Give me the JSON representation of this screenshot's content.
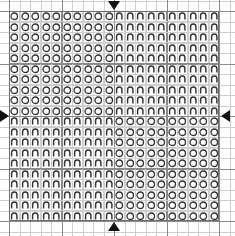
{
  "chart": {
    "grid": {
      "columns": 20,
      "rows": 20,
      "cell_size_px": 10.5,
      "bold_line_every": 5,
      "grid_visible": true
    },
    "colors": {
      "background": "#ffffff",
      "light_grid": "#cfcfcf",
      "bold_grid": "#8a8a8a",
      "outer_border": "#6e6e6e",
      "symbol_stroke": "#333333",
      "arrow": "#111111"
    },
    "legend": [
      {
        "key": "circle",
        "symbol_name": "open-circle-symbol",
        "glyph": "○"
      },
      {
        "key": "arch",
        "symbol_name": "arch-symbol",
        "glyph": "Ԡ"
      }
    ],
    "center_markers": [
      {
        "name": "top-center-arrow",
        "glyph": "▼",
        "edge": "top",
        "at_column": 10
      },
      {
        "name": "bottom-center-arrow",
        "glyph": "▲",
        "edge": "bottom",
        "at_column": 10
      },
      {
        "name": "left-center-arrow",
        "glyph": "▶",
        "edge": "left",
        "at_row": 10
      },
      {
        "name": "right-center-arrow",
        "glyph": "◀",
        "edge": "right",
        "at_row": 10
      }
    ]
  },
  "chart_data": {
    "type": "heatmap",
    "xlabel": "",
    "ylabel": "",
    "categories": [
      "1",
      "2",
      "3",
      "4",
      "5",
      "6",
      "7",
      "8",
      "9",
      "10",
      "11",
      "12",
      "13",
      "14",
      "15",
      "16",
      "17",
      "18",
      "19",
      "20"
    ],
    "row_labels": [
      "1",
      "2",
      "3",
      "4",
      "5",
      "6",
      "7",
      "8",
      "9",
      "10",
      "11",
      "12",
      "13",
      "14",
      "15",
      "16",
      "17",
      "18",
      "19",
      "20"
    ],
    "symbols": {
      "circle": "open circle",
      "arch": "arch (inverted U)"
    },
    "legend_position": "none",
    "grid": true,
    "xlim": [
      0,
      20
    ],
    "ylim": [
      0,
      20
    ],
    "rows": [
      [
        "circle",
        "circle",
        "circle",
        "circle",
        "circle",
        "circle",
        "circle",
        "circle",
        "circle",
        "circle",
        "arch",
        "arch",
        "arch",
        "arch",
        "arch",
        "arch",
        "arch",
        "arch",
        "arch",
        "arch"
      ],
      [
        "circle",
        "circle",
        "circle",
        "circle",
        "circle",
        "circle",
        "circle",
        "circle",
        "circle",
        "circle",
        "arch",
        "arch",
        "arch",
        "arch",
        "arch",
        "arch",
        "arch",
        "arch",
        "arch",
        "arch"
      ],
      [
        "circle",
        "circle",
        "circle",
        "circle",
        "circle",
        "circle",
        "circle",
        "circle",
        "circle",
        "circle",
        "arch",
        "arch",
        "arch",
        "arch",
        "arch",
        "arch",
        "arch",
        "arch",
        "arch",
        "arch"
      ],
      [
        "circle",
        "circle",
        "circle",
        "circle",
        "circle",
        "circle",
        "circle",
        "circle",
        "circle",
        "circle",
        "arch",
        "arch",
        "arch",
        "arch",
        "arch",
        "arch",
        "arch",
        "arch",
        "arch",
        "arch"
      ],
      [
        "circle",
        "circle",
        "circle",
        "circle",
        "circle",
        "circle",
        "circle",
        "circle",
        "circle",
        "circle",
        "arch",
        "arch",
        "arch",
        "arch",
        "arch",
        "arch",
        "arch",
        "arch",
        "arch",
        "arch"
      ],
      [
        "circle",
        "circle",
        "circle",
        "circle",
        "circle",
        "circle",
        "circle",
        "circle",
        "circle",
        "circle",
        "arch",
        "arch",
        "arch",
        "arch",
        "arch",
        "arch",
        "arch",
        "arch",
        "arch",
        "arch"
      ],
      [
        "circle",
        "circle",
        "circle",
        "circle",
        "circle",
        "circle",
        "circle",
        "circle",
        "circle",
        "circle",
        "arch",
        "arch",
        "arch",
        "arch",
        "arch",
        "arch",
        "arch",
        "arch",
        "arch",
        "arch"
      ],
      [
        "circle",
        "circle",
        "circle",
        "circle",
        "circle",
        "circle",
        "circle",
        "circle",
        "circle",
        "circle",
        "arch",
        "arch",
        "arch",
        "arch",
        "arch",
        "arch",
        "arch",
        "arch",
        "arch",
        "arch"
      ],
      [
        "circle",
        "circle",
        "circle",
        "circle",
        "circle",
        "circle",
        "circle",
        "circle",
        "circle",
        "circle",
        "arch",
        "arch",
        "arch",
        "arch",
        "arch",
        "arch",
        "arch",
        "arch",
        "arch",
        "arch"
      ],
      [
        "circle",
        "circle",
        "circle",
        "circle",
        "circle",
        "circle",
        "circle",
        "circle",
        "circle",
        "circle",
        "arch",
        "arch",
        "arch",
        "arch",
        "arch",
        "arch",
        "arch",
        "arch",
        "arch",
        "arch"
      ],
      [
        "arch",
        "arch",
        "arch",
        "arch",
        "arch",
        "arch",
        "arch",
        "arch",
        "arch",
        "arch",
        "circle",
        "circle",
        "circle",
        "circle",
        "circle",
        "circle",
        "circle",
        "circle",
        "circle",
        "circle"
      ],
      [
        "arch",
        "arch",
        "arch",
        "arch",
        "arch",
        "arch",
        "arch",
        "arch",
        "arch",
        "arch",
        "circle",
        "circle",
        "circle",
        "circle",
        "circle",
        "circle",
        "circle",
        "circle",
        "circle",
        "circle"
      ],
      [
        "arch",
        "arch",
        "arch",
        "arch",
        "arch",
        "arch",
        "arch",
        "arch",
        "arch",
        "arch",
        "circle",
        "circle",
        "circle",
        "circle",
        "circle",
        "circle",
        "circle",
        "circle",
        "circle",
        "circle"
      ],
      [
        "arch",
        "arch",
        "arch",
        "arch",
        "arch",
        "arch",
        "arch",
        "arch",
        "arch",
        "arch",
        "circle",
        "circle",
        "circle",
        "circle",
        "circle",
        "circle",
        "circle",
        "circle",
        "circle",
        "circle"
      ],
      [
        "arch",
        "arch",
        "arch",
        "arch",
        "arch",
        "arch",
        "arch",
        "arch",
        "arch",
        "arch",
        "circle",
        "circle",
        "circle",
        "circle",
        "circle",
        "circle",
        "circle",
        "circle",
        "circle",
        "circle"
      ],
      [
        "arch",
        "arch",
        "arch",
        "arch",
        "arch",
        "arch",
        "arch",
        "arch",
        "arch",
        "arch",
        "circle",
        "circle",
        "circle",
        "circle",
        "circle",
        "circle",
        "circle",
        "circle",
        "circle",
        "circle"
      ],
      [
        "arch",
        "arch",
        "arch",
        "arch",
        "arch",
        "arch",
        "arch",
        "arch",
        "arch",
        "arch",
        "circle",
        "circle",
        "circle",
        "circle",
        "circle",
        "circle",
        "circle",
        "circle",
        "circle",
        "circle"
      ],
      [
        "arch",
        "arch",
        "arch",
        "arch",
        "arch",
        "arch",
        "arch",
        "arch",
        "arch",
        "arch",
        "circle",
        "circle",
        "circle",
        "circle",
        "circle",
        "circle",
        "circle",
        "circle",
        "circle",
        "circle"
      ],
      [
        "arch",
        "arch",
        "arch",
        "arch",
        "arch",
        "arch",
        "arch",
        "arch",
        "arch",
        "arch",
        "circle",
        "circle",
        "circle",
        "circle",
        "circle",
        "circle",
        "circle",
        "circle",
        "circle",
        "circle"
      ],
      [
        "arch",
        "arch",
        "arch",
        "arch",
        "arch",
        "arch",
        "arch",
        "arch",
        "arch",
        "arch",
        "circle",
        "circle",
        "circle",
        "circle",
        "circle",
        "circle",
        "circle",
        "circle",
        "circle",
        "circle"
      ]
    ]
  }
}
